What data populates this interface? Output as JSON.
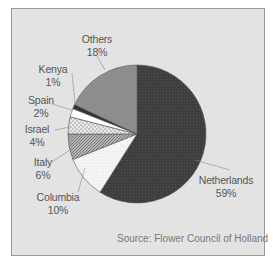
{
  "chart_data": {
    "type": "pie",
    "title": "",
    "categories": [
      "Netherlands",
      "Columbia",
      "Italy",
      "Israel",
      "Spain",
      "Kenya",
      "Others"
    ],
    "values": [
      59,
      10,
      6,
      4,
      2,
      1,
      18
    ],
    "labels": [
      {
        "name": "Netherlands",
        "pct": "59%"
      },
      {
        "name": "Columbia",
        "pct": "10%"
      },
      {
        "name": "Italy",
        "pct": "6%"
      },
      {
        "name": "Israel",
        "pct": "4%"
      },
      {
        "name": "Spain",
        "pct": "2%"
      },
      {
        "name": "Kenya",
        "pct": "1%"
      },
      {
        "name": "Others",
        "pct": "18%"
      }
    ],
    "fills": {
      "Netherlands": "#3c3c3c",
      "Columbia": "#f4f4f4",
      "Italy": "#a8a8a8",
      "Israel": "#d8d8d8",
      "Spain": "#ffffff",
      "Kenya": "#333333",
      "Others": "#8a8a8a"
    },
    "start_angle_deg": 0,
    "direction": "clockwise",
    "source": "Source: Flower Council of Holland"
  }
}
